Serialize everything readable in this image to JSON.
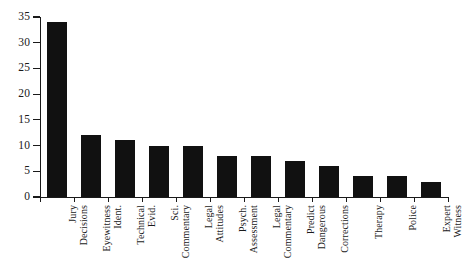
{
  "chart_data": {
    "type": "bar",
    "title": "",
    "subtitle": "",
    "xlabel": "",
    "ylabel": "",
    "ylim": [
      0,
      35
    ],
    "ytick_step": 5,
    "yticks": [
      "0",
      "5",
      "10",
      "15",
      "20",
      "25",
      "30",
      "35"
    ],
    "grid": false,
    "legend": null,
    "orientation": "vertical",
    "bar_color": "#111111",
    "axis_color": "#1a1a1a",
    "background_color": "#ffffff",
    "categories": [
      "Jury\nDecisions",
      "Eyewitness\nIdent.",
      "Technical\nEvid.",
      "Sci.\nCommentary",
      "Legal\nAttitudes",
      "Psych.\nAssessment",
      "Legal\nCommentary",
      "Predict\nDangerous",
      "Corrections",
      "Therapy",
      "Police",
      "Expert\nWitness"
    ],
    "values": [
      34,
      12,
      11,
      10,
      10,
      8,
      8,
      7,
      6,
      4,
      4,
      3
    ]
  }
}
